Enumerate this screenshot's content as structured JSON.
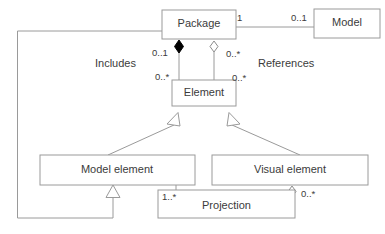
{
  "diagram": {
    "type": "uml-class-diagram",
    "background_color": "#ffffff",
    "line_color": "#9a9a9a",
    "text_color": "#3b3b3b",
    "classes": [
      {
        "id": "package",
        "label": "Package"
      },
      {
        "id": "model",
        "label": "Model"
      },
      {
        "id": "element",
        "label": "Element"
      },
      {
        "id": "model_element",
        "label": "Model element"
      },
      {
        "id": "visual_element",
        "label": "Visual element"
      },
      {
        "id": "projection",
        "label": "Projection"
      }
    ],
    "association_labels": [
      {
        "id": "includes",
        "label": "Includes"
      },
      {
        "id": "references",
        "label": "References"
      }
    ],
    "multiplicities": [
      {
        "id": "package-model-source",
        "label": "1"
      },
      {
        "id": "package-model-target",
        "label": "0..1"
      },
      {
        "id": "includes-package-end",
        "label": "0..1"
      },
      {
        "id": "includes-element-end",
        "label": "0..*"
      },
      {
        "id": "references-package-end",
        "label": "0..*"
      },
      {
        "id": "references-element-end",
        "label": "0..*"
      },
      {
        "id": "projection-model-element-end",
        "label": "1..*"
      },
      {
        "id": "projection-visual-element-end",
        "label": "0..*"
      }
    ]
  }
}
